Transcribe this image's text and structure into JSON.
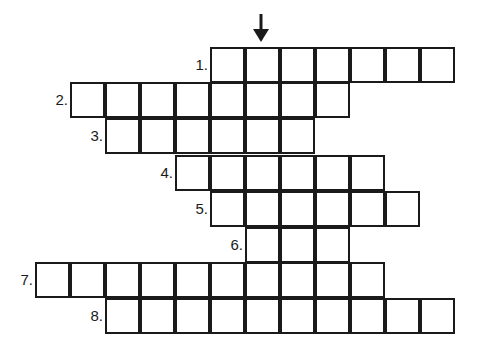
{
  "puzzle": {
    "arrow": {
      "x": 261,
      "y_top": 14,
      "y_bottom": 41,
      "direction": "down",
      "icon": "down-arrow-icon"
    },
    "cell_width": 35,
    "cell_height": 36,
    "rows": [
      {
        "label": "1.",
        "top": 48,
        "left": 211,
        "cells": 7
      },
      {
        "label": "2.",
        "top": 83,
        "left": 71,
        "cells": 8
      },
      {
        "label": "3.",
        "top": 119,
        "left": 106,
        "cells": 6
      },
      {
        "label": "4.",
        "top": 156,
        "left": 176,
        "cells": 6
      },
      {
        "label": "5.",
        "top": 192,
        "left": 211,
        "cells": 6
      },
      {
        "label": "6.",
        "top": 228,
        "left": 246,
        "cells": 3
      },
      {
        "label": "7.",
        "top": 263,
        "left": 36,
        "cells": 10
      },
      {
        "label": "8.",
        "top": 299,
        "left": 106,
        "cells": 10
      }
    ]
  }
}
